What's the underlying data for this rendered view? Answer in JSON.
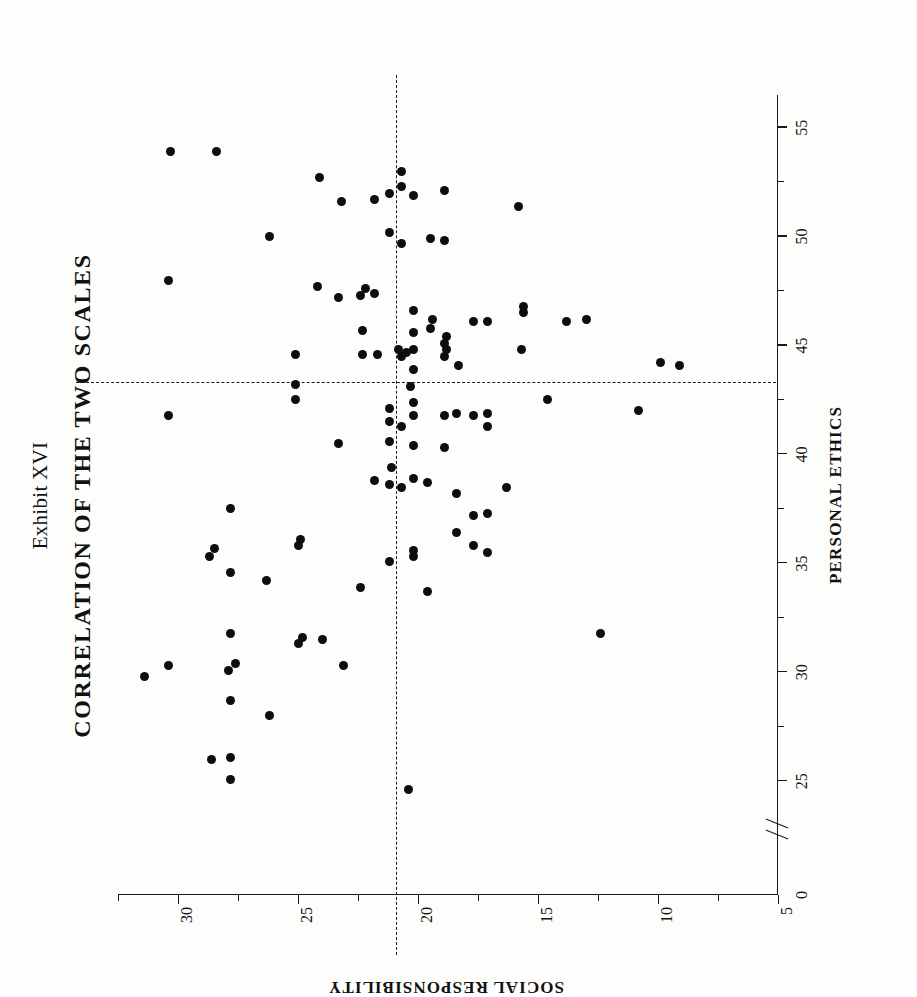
{
  "figure": {
    "exhibit_label": "Exhibit XVI",
    "title": "CORRELATION OF THE TWO SCALES",
    "orientation": "rotated-90-ccw",
    "ink_color": "#0d0d0d",
    "paper_color": "#fdfdfc"
  },
  "chart_data": {
    "type": "scatter",
    "title": "CORRELATION OF THE TWO SCALES",
    "subtitle": "Exhibit XVI",
    "xlabel": "PERSONAL ETHICS",
    "ylabel": "SOCIAL RESPONSIBILITY",
    "xlim": [
      24,
      56.5
    ],
    "ylim": [
      5,
      32.5
    ],
    "x_ticks_major": [
      25,
      30,
      35,
      40,
      45,
      50,
      55
    ],
    "x_ticks_minor": [
      27.5,
      32.5,
      37.5,
      42.5,
      47.5,
      52.5
    ],
    "x_tick_labels": [
      "0",
      "25",
      "30",
      "35",
      "40",
      "45",
      "50",
      "55"
    ],
    "x_axis_break": true,
    "x_axis_break_label": "//",
    "x_origin_label": "0",
    "y_ticks_major": [
      10,
      15,
      20,
      25,
      30
    ],
    "y_ticks_minor": [
      7.5,
      12.5,
      17.5,
      22.5,
      27.5,
      32.5
    ],
    "y_tick_labels": [
      "5",
      "10",
      "15",
      "20",
      "25",
      "30"
    ],
    "y_origin_label": "5",
    "grid": false,
    "legend": null,
    "reference_lines": {
      "vertical_x": 43.3,
      "horizontal_y": 20.9,
      "style": "dashed",
      "note": "mean lines of the two scales"
    },
    "marker": {
      "shape": "circle",
      "color": "#0d0d0d",
      "size_px": 9
    },
    "n_points": 118,
    "points": [
      [
        29.8,
        31.4
      ],
      [
        30.3,
        30.4
      ],
      [
        41.8,
        30.4
      ],
      [
        48.0,
        30.4
      ],
      [
        53.9,
        30.3
      ],
      [
        26.0,
        28.6
      ],
      [
        35.3,
        28.7
      ],
      [
        35.7,
        28.5
      ],
      [
        53.9,
        28.4
      ],
      [
        25.1,
        27.8
      ],
      [
        26.1,
        27.8
      ],
      [
        28.7,
        27.8
      ],
      [
        30.1,
        27.9
      ],
      [
        30.4,
        27.6
      ],
      [
        31.8,
        27.8
      ],
      [
        34.6,
        27.8
      ],
      [
        37.5,
        27.8
      ],
      [
        28.0,
        26.2
      ],
      [
        34.2,
        26.3
      ],
      [
        50.0,
        26.2
      ],
      [
        31.3,
        25.0
      ],
      [
        31.6,
        24.8
      ],
      [
        35.8,
        25.0
      ],
      [
        36.1,
        24.9
      ],
      [
        42.5,
        25.1
      ],
      [
        43.2,
        25.1
      ],
      [
        44.6,
        25.1
      ],
      [
        31.5,
        24.0
      ],
      [
        47.7,
        24.2
      ],
      [
        52.7,
        24.1
      ],
      [
        30.3,
        23.1
      ],
      [
        47.2,
        23.3
      ],
      [
        51.6,
        23.2
      ],
      [
        40.5,
        23.3
      ],
      [
        33.9,
        22.4
      ],
      [
        44.6,
        22.3
      ],
      [
        45.7,
        22.3
      ],
      [
        47.3,
        22.4
      ],
      [
        47.6,
        22.2
      ],
      [
        38.8,
        21.8
      ],
      [
        44.6,
        21.7
      ],
      [
        47.4,
        21.8
      ],
      [
        51.7,
        21.8
      ],
      [
        35.1,
        21.2
      ],
      [
        38.6,
        21.2
      ],
      [
        39.4,
        21.1
      ],
      [
        40.6,
        21.2
      ],
      [
        41.5,
        21.2
      ],
      [
        42.1,
        21.2
      ],
      [
        50.2,
        21.2
      ],
      [
        52.0,
        21.2
      ],
      [
        38.5,
        20.7
      ],
      [
        41.3,
        20.7
      ],
      [
        44.5,
        20.7
      ],
      [
        44.7,
        20.5
      ],
      [
        44.8,
        20.8
      ],
      [
        49.7,
        20.7
      ],
      [
        52.3,
        20.7
      ],
      [
        53.0,
        20.7
      ],
      [
        24.6,
        20.4
      ],
      [
        35.3,
        20.2
      ],
      [
        35.6,
        20.2
      ],
      [
        38.9,
        20.2
      ],
      [
        40.4,
        20.2
      ],
      [
        41.8,
        20.2
      ],
      [
        42.4,
        20.2
      ],
      [
        43.1,
        20.3
      ],
      [
        43.9,
        20.2
      ],
      [
        44.8,
        20.2
      ],
      [
        45.6,
        20.2
      ],
      [
        46.6,
        20.2
      ],
      [
        51.9,
        20.2
      ],
      [
        33.7,
        19.6
      ],
      [
        38.7,
        19.6
      ],
      [
        45.8,
        19.5
      ],
      [
        46.2,
        19.4
      ],
      [
        49.9,
        19.5
      ],
      [
        40.3,
        18.9
      ],
      [
        41.8,
        18.9
      ],
      [
        44.5,
        18.9
      ],
      [
        44.8,
        18.8
      ],
      [
        45.1,
        18.9
      ],
      [
        45.4,
        18.8
      ],
      [
        49.8,
        18.9
      ],
      [
        52.1,
        18.9
      ],
      [
        36.4,
        18.4
      ],
      [
        38.2,
        18.4
      ],
      [
        41.9,
        18.4
      ],
      [
        44.1,
        18.3
      ],
      [
        35.8,
        17.7
      ],
      [
        37.2,
        17.7
      ],
      [
        41.8,
        17.7
      ],
      [
        46.1,
        17.7
      ],
      [
        35.5,
        17.1
      ],
      [
        37.3,
        17.1
      ],
      [
        41.3,
        17.1
      ],
      [
        41.9,
        17.1
      ],
      [
        46.1,
        17.1
      ],
      [
        38.5,
        16.3
      ],
      [
        44.8,
        15.7
      ],
      [
        46.5,
        15.6
      ],
      [
        46.8,
        15.6
      ],
      [
        51.4,
        15.8
      ],
      [
        42.5,
        14.6
      ],
      [
        46.1,
        13.8
      ],
      [
        46.2,
        13.0
      ],
      [
        31.8,
        12.4
      ],
      [
        42.0,
        10.8
      ],
      [
        44.2,
        9.9
      ],
      [
        44.1,
        9.1
      ]
    ]
  },
  "axes": {
    "x": {
      "label": "PERSONAL ETHICS",
      "ticks": [
        {
          "value": "0",
          "pos": 0,
          "kind": "origin"
        },
        {
          "value": "25",
          "pos": 25,
          "kind": "major"
        },
        {
          "value": "",
          "pos": 27.5,
          "kind": "minor"
        },
        {
          "value": "30",
          "pos": 30,
          "kind": "major"
        },
        {
          "value": "",
          "pos": 32.5,
          "kind": "minor"
        },
        {
          "value": "35",
          "pos": 35,
          "kind": "major"
        },
        {
          "value": "",
          "pos": 37.5,
          "kind": "minor"
        },
        {
          "value": "40",
          "pos": 40,
          "kind": "major"
        },
        {
          "value": "",
          "pos": 42.5,
          "kind": "minor"
        },
        {
          "value": "45",
          "pos": 45,
          "kind": "major"
        },
        {
          "value": "",
          "pos": 47.5,
          "kind": "minor"
        },
        {
          "value": "50",
          "pos": 50,
          "kind": "major"
        },
        {
          "value": "",
          "pos": 52.5,
          "kind": "minor"
        },
        {
          "value": "55",
          "pos": 55,
          "kind": "major"
        }
      ]
    },
    "y": {
      "label": "SOCIAL RESPONSIBILITY",
      "ticks": [
        {
          "value": "5",
          "pos": 5,
          "kind": "origin"
        },
        {
          "value": "",
          "pos": 7.5,
          "kind": "minor"
        },
        {
          "value": "10",
          "pos": 10,
          "kind": "major"
        },
        {
          "value": "",
          "pos": 12.5,
          "kind": "minor"
        },
        {
          "value": "15",
          "pos": 15,
          "kind": "major"
        },
        {
          "value": "",
          "pos": 17.5,
          "kind": "minor"
        },
        {
          "value": "20",
          "pos": 20,
          "kind": "major"
        },
        {
          "value": "",
          "pos": 22.5,
          "kind": "minor"
        },
        {
          "value": "25",
          "pos": 25,
          "kind": "major"
        },
        {
          "value": "",
          "pos": 27.5,
          "kind": "minor"
        },
        {
          "value": "30",
          "pos": 30,
          "kind": "major"
        },
        {
          "value": "",
          "pos": 32.5,
          "kind": "minor"
        }
      ]
    }
  }
}
